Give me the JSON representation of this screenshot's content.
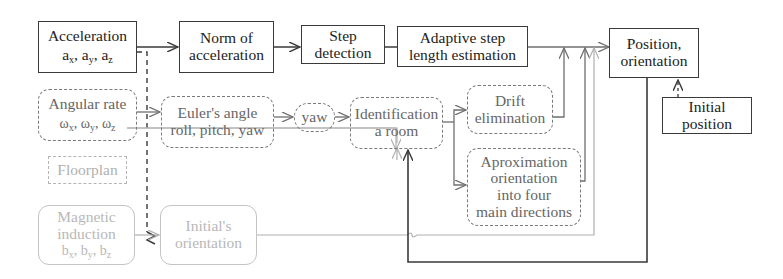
{
  "diagram": {
    "nodes": {
      "acceleration": {
        "line1": "Acceleration",
        "line2": {
          "a": "a",
          "x": "x",
          "y": "y",
          "z": "z"
        }
      },
      "norm": {
        "line1": "Norm of",
        "line2": "acceleration"
      },
      "step_detection": {
        "line1": "Step",
        "line2": "detection"
      },
      "adaptive": {
        "line1": "Adaptive step",
        "line2": "length estimation"
      },
      "position": {
        "line1": "Position,",
        "line2": "orientation"
      },
      "initial_position": {
        "line1": "Initial",
        "line2": "position"
      },
      "angular_rate": {
        "line1": "Angular rate",
        "line2": {
          "w": "ω",
          "x": "x",
          "y": "y",
          "z": "z"
        }
      },
      "euler": {
        "line1": "Euler's angle",
        "line2": "roll, pitch, yaw"
      },
      "yaw": {
        "line1": "yaw"
      },
      "identification": {
        "line1": "Identification",
        "line2": "a room"
      },
      "drift": {
        "line1": "Drift",
        "line2": "elimination"
      },
      "approximation": {
        "line1": "Aproximation",
        "line2": "orientation",
        "line3": "into four",
        "line4": "main directions"
      },
      "floorplan": {
        "line1": "Floorplan"
      },
      "magnetic": {
        "line1": "Magnetic",
        "line2": "induction",
        "line3": {
          "b": "b",
          "x": "x",
          "y": "y",
          "z": "z"
        }
      },
      "initials_orientation": {
        "line1": "Initial's",
        "line2": "orientation"
      }
    },
    "sep": ", ",
    "colors": {
      "solid": "#3a3a3a",
      "dashed_dark": "#7a7a7a",
      "light": "#b5b5b5"
    }
  }
}
